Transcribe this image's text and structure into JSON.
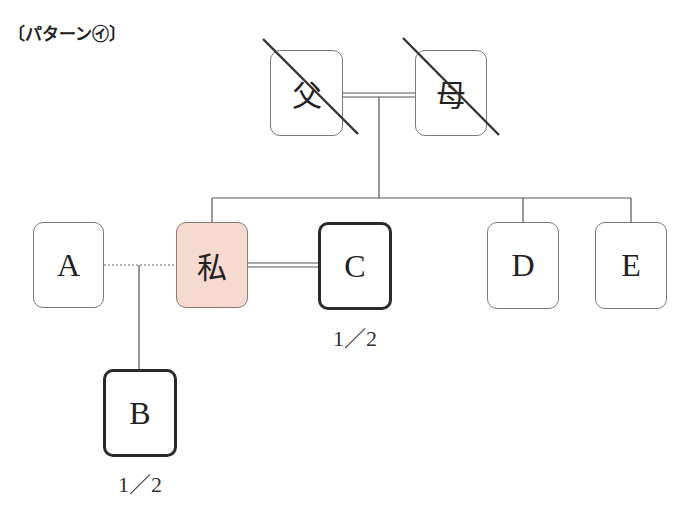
{
  "title": "〔パターン㋑〕",
  "persons": {
    "father": {
      "label": "父",
      "deceased": true
    },
    "mother": {
      "label": "母",
      "deceased": true
    },
    "self": {
      "label": "私",
      "highlight_color": "#f6d9cf"
    },
    "a": {
      "label": "A",
      "relation": "former partner (not married)"
    },
    "b": {
      "label": "B",
      "share": "1／2"
    },
    "c": {
      "label": "C",
      "share": "1／2"
    },
    "d": {
      "label": "D"
    },
    "e": {
      "label": "E"
    }
  },
  "legend": {
    "double_line": "marriage",
    "dotted_line": "non-marital relationship",
    "thick_border": "heir",
    "strike_through": "deceased"
  }
}
